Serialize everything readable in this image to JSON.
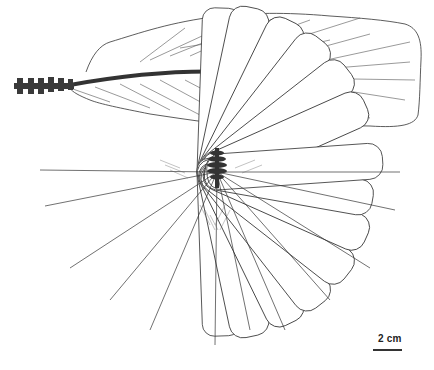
{
  "figure": {
    "panels": [
      {
        "id": "top",
        "description": "lateral view of tail with vertebral column and feather fan"
      },
      {
        "id": "bottom",
        "description": "dorsal view of tail with radiating fan of rectrices"
      }
    ],
    "scale_bar": {
      "label": "2 cm"
    },
    "colors": {
      "outline": "#333333",
      "vertebrae": "#3a3a3a",
      "background": "#ffffff"
    }
  }
}
